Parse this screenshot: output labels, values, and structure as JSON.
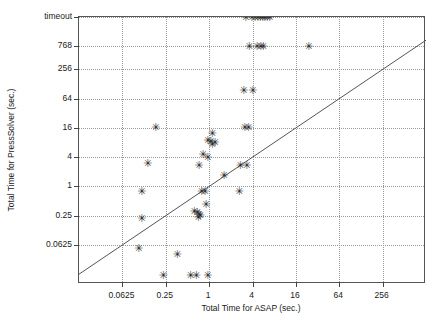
{
  "chart_data": {
    "type": "scatter",
    "title": "",
    "xlabel": "Total Time for ASAP (sec.)",
    "ylabel": "Total Time for PressSolver (sec.)",
    "grid": true,
    "legend": null,
    "x_scale": "log2",
    "y_scale": "log2",
    "x_ticks": [
      "0.0625",
      "0.25",
      "1",
      "4",
      "16",
      "64",
      "256"
    ],
    "x_tick_values": [
      0.0625,
      0.25,
      1,
      4,
      16,
      64,
      256
    ],
    "y_ticks": [
      "timeout",
      "768",
      "256",
      "64",
      "16",
      "4",
      "1",
      "0.25",
      "0.0625"
    ],
    "y_tick_values": [
      3072,
      768,
      256,
      64,
      16,
      4,
      1,
      0.25,
      0.0625
    ],
    "xlim": [
      0.0156,
      1024
    ],
    "ylim": [
      0.0098,
      3072
    ],
    "reference_line": {
      "label": "y = x",
      "type": "diagonal"
    },
    "marker": "asterisk",
    "marker_color": "#2a2a2a",
    "points": [
      {
        "x": 3.2,
        "y": 3072
      },
      {
        "x": 3.9,
        "y": 3072
      },
      {
        "x": 4.3,
        "y": 3072
      },
      {
        "x": 4.7,
        "y": 3072
      },
      {
        "x": 5.1,
        "y": 3072
      },
      {
        "x": 5.5,
        "y": 3072
      },
      {
        "x": 5.9,
        "y": 3072
      },
      {
        "x": 6.4,
        "y": 3072
      },
      {
        "x": 6.9,
        "y": 3072
      },
      {
        "x": 3.6,
        "y": 768
      },
      {
        "x": 4.6,
        "y": 768
      },
      {
        "x": 5.2,
        "y": 768
      },
      {
        "x": 5.6,
        "y": 768
      },
      {
        "x": 24.0,
        "y": 768
      },
      {
        "x": 3.0,
        "y": 96
      },
      {
        "x": 4.0,
        "y": 96
      },
      {
        "x": 0.18,
        "y": 16.5
      },
      {
        "x": 3.1,
        "y": 16.5
      },
      {
        "x": 3.5,
        "y": 16.5
      },
      {
        "x": 1.1,
        "y": 12.0
      },
      {
        "x": 0.95,
        "y": 9.0
      },
      {
        "x": 1.05,
        "y": 8.6
      },
      {
        "x": 1.2,
        "y": 8.2
      },
      {
        "x": 1.1,
        "y": 7.4
      },
      {
        "x": 0.82,
        "y": 4.6
      },
      {
        "x": 0.95,
        "y": 3.9
      },
      {
        "x": 0.14,
        "y": 3.0
      },
      {
        "x": 0.72,
        "y": 2.7
      },
      {
        "x": 2.7,
        "y": 2.7
      },
      {
        "x": 3.3,
        "y": 2.7
      },
      {
        "x": 1.6,
        "y": 1.7
      },
      {
        "x": 0.115,
        "y": 0.78
      },
      {
        "x": 0.78,
        "y": 0.78
      },
      {
        "x": 0.87,
        "y": 0.78
      },
      {
        "x": 2.6,
        "y": 0.78
      },
      {
        "x": 0.9,
        "y": 0.42
      },
      {
        "x": 0.62,
        "y": 0.3
      },
      {
        "x": 0.68,
        "y": 0.29
      },
      {
        "x": 0.72,
        "y": 0.27
      },
      {
        "x": 0.75,
        "y": 0.25
      },
      {
        "x": 0.7,
        "y": 0.23
      },
      {
        "x": 0.115,
        "y": 0.22
      },
      {
        "x": 0.105,
        "y": 0.053
      },
      {
        "x": 0.36,
        "y": 0.04
      },
      {
        "x": 0.23,
        "y": 0.0145
      },
      {
        "x": 0.55,
        "y": 0.0145
      },
      {
        "x": 0.66,
        "y": 0.0145
      },
      {
        "x": 0.95,
        "y": 0.0145
      }
    ]
  }
}
